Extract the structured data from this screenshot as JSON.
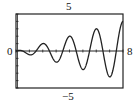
{
  "labels": {
    "ymax": "5",
    "ymin": "−5",
    "xmin": "0",
    "xmax": "8"
  },
  "colors": {
    "curve": "#222222",
    "frame": "#222222",
    "background": "#ffffff"
  },
  "chart_data": {
    "type": "line",
    "title": "",
    "xlabel": "",
    "ylabel": "",
    "xlim": [
      0,
      8
    ],
    "ylim": [
      -5,
      5
    ],
    "grid": false,
    "legend": null,
    "x_tick_step": 1,
    "y_tick_step": 1,
    "function_estimate": "y = 0.5·x·cos(πx)",
    "series": [
      {
        "name": "curve",
        "x": [
          0,
          0.5,
          1,
          1.5,
          2,
          2.5,
          3,
          3.5,
          4,
          4.5,
          5,
          5.5,
          6,
          6.5,
          7,
          7.5,
          8
        ],
        "values": [
          0,
          0,
          -0.5,
          0,
          1.0,
          0,
          -1.5,
          0,
          2.0,
          0,
          -2.5,
          0,
          3.0,
          0,
          -3.5,
          0,
          4.0
        ]
      }
    ]
  }
}
